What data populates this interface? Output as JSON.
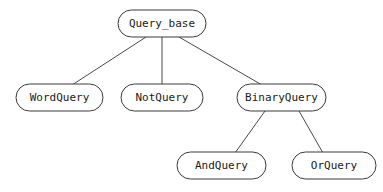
{
  "diagram": {
    "kind": "class-inheritance-hierarchy",
    "background_color": "#ffffff",
    "node_fill": "#ffffff",
    "node_stroke": "#3a3a3a",
    "edge_stroke": "#4a4a4a",
    "label_color": "#1a1a1a",
    "nodes": [
      {
        "id": "query_base",
        "label": "Query_base",
        "level": 0,
        "x": 118,
        "y": 10,
        "w": 88,
        "h": 27,
        "cx": 162,
        "cy": 23.5
      },
      {
        "id": "word_query",
        "label": "WordQuery",
        "level": 1,
        "x": 16,
        "y": 84,
        "w": 87,
        "h": 27,
        "cx": 59.5,
        "cy": 97.5
      },
      {
        "id": "not_query",
        "label": "NotQuery",
        "level": 1,
        "x": 121,
        "y": 84,
        "w": 82,
        "h": 27,
        "cx": 162,
        "cy": 97.5
      },
      {
        "id": "binary_query",
        "label": "BinaryQuery",
        "level": 1,
        "x": 237,
        "y": 84,
        "w": 89,
        "h": 27,
        "cx": 281.5,
        "cy": 97.5
      },
      {
        "id": "and_query",
        "label": "AndQuery",
        "level": 2,
        "x": 177,
        "y": 152,
        "w": 89,
        "h": 27,
        "cx": 221.5,
        "cy": 165.5
      },
      {
        "id": "or_query",
        "label": "OrQuery",
        "level": 2,
        "x": 292,
        "y": 152,
        "w": 84,
        "h": 27,
        "cx": 334,
        "cy": 165.5
      }
    ],
    "edges": [
      {
        "id": "edge-query_base-word_query",
        "from": "query_base",
        "to": "word_query",
        "x1": 146,
        "y1": 37,
        "x2": 72,
        "y2": 85
      },
      {
        "id": "edge-query_base-not_query",
        "from": "query_base",
        "to": "not_query",
        "x1": 162,
        "y1": 37,
        "x2": 162,
        "y2": 84
      },
      {
        "id": "edge-query_base-binary_query",
        "from": "query_base",
        "to": "binary_query",
        "x1": 179,
        "y1": 37,
        "x2": 262,
        "y2": 85
      },
      {
        "id": "edge-binary_query-and_query",
        "from": "binary_query",
        "to": "and_query",
        "x1": 265,
        "y1": 111,
        "x2": 235,
        "y2": 153
      },
      {
        "id": "edge-binary_query-or_query",
        "from": "binary_query",
        "to": "or_query",
        "x1": 299,
        "y1": 111,
        "x2": 323,
        "y2": 153
      }
    ]
  }
}
